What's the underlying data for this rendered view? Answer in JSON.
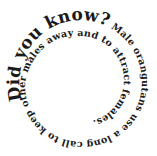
{
  "graphic": {
    "type": "spiral-text",
    "heading": "Did you know?",
    "body": " Male orangutans use a long call to keep other males away and to attract females.",
    "text_color": "#1a1a1a",
    "background": "#ffffff"
  }
}
